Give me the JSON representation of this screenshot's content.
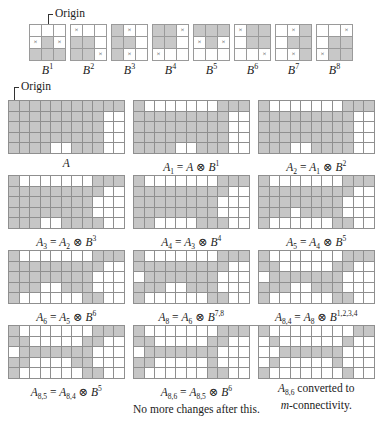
{
  "origin_label": "Origin",
  "structuring_elements": [
    {
      "name": "B",
      "sup": "1",
      "cells": [
        "W",
        "W",
        "W",
        "X",
        "F",
        "X",
        "F",
        "F",
        "F"
      ]
    },
    {
      "name": "B",
      "sup": "2",
      "cells": [
        "X",
        "W",
        "W",
        "F",
        "F",
        "W",
        "F",
        "F",
        "X"
      ]
    },
    {
      "name": "B",
      "sup": "3",
      "cells": [
        "F",
        "X",
        "W",
        "F",
        "F",
        "W",
        "F",
        "X",
        "W"
      ]
    },
    {
      "name": "B",
      "sup": "4",
      "cells": [
        "F",
        "F",
        "X",
        "F",
        "F",
        "W",
        "X",
        "W",
        "W"
      ]
    },
    {
      "name": "B",
      "sup": "5",
      "cells": [
        "F",
        "F",
        "F",
        "X",
        "F",
        "X",
        "W",
        "W",
        "W"
      ]
    },
    {
      "name": "B",
      "sup": "6",
      "cells": [
        "X",
        "F",
        "F",
        "W",
        "F",
        "F",
        "W",
        "W",
        "X"
      ]
    },
    {
      "name": "B",
      "sup": "7",
      "cells": [
        "W",
        "X",
        "F",
        "W",
        "F",
        "F",
        "W",
        "X",
        "F"
      ]
    },
    {
      "name": "B",
      "sup": "8",
      "cells": [
        "W",
        "W",
        "X",
        "W",
        "F",
        "F",
        "X",
        "F",
        "F"
      ]
    }
  ],
  "cross_symbol": "×",
  "panels": [
    {
      "id": "A",
      "caption": {
        "lhs": "A",
        "lhs_sub": "",
        "rhs": "",
        "rhs_sub": "",
        "op": "",
        "se": "",
        "se_sup": "",
        "extra": ""
      },
      "rows": [
        "11111111111",
        "11111111100",
        "11111111100",
        "11111111100",
        "11110011100"
      ]
    },
    {
      "id": "A1",
      "caption": {
        "lhs": "A",
        "lhs_sub": "1",
        "rhs": "A",
        "rhs_sub": "",
        "op": "⊗",
        "se": "B",
        "se_sup": "1",
        "extra": ""
      },
      "rows": [
        "10000000111",
        "11111111100",
        "11111111100",
        "11111111100",
        "11110011100"
      ]
    },
    {
      "id": "A2",
      "caption": {
        "lhs": "A",
        "lhs_sub": "2",
        "rhs": "A",
        "rhs_sub": "1",
        "op": "⊗",
        "se": "B",
        "se_sup": "2",
        "extra": ""
      },
      "rows": [
        "10000000111",
        "11111111100",
        "11111111100",
        "11111111100",
        "11100111100"
      ]
    },
    {
      "id": "A3",
      "caption": {
        "lhs": "A",
        "lhs_sub": "3",
        "rhs": "A",
        "rhs_sub": "2",
        "op": "⊗",
        "se": "B",
        "se_sup": "3",
        "extra": ""
      },
      "rows": [
        "10000000111",
        "11111111100",
        "11111111000",
        "11111111000",
        "11100111100"
      ]
    },
    {
      "id": "A4",
      "caption": {
        "lhs": "A",
        "lhs_sub": "4",
        "rhs": "A",
        "rhs_sub": "3",
        "op": "⊗",
        "se": "B",
        "se_sup": "4",
        "extra": ""
      },
      "rows": [
        "10000000111",
        "11111111100",
        "11111111000",
        "11111111000",
        "11000011100"
      ]
    },
    {
      "id": "A5",
      "caption": {
        "lhs": "A",
        "lhs_sub": "5",
        "rhs": "A",
        "rhs_sub": "4",
        "op": "⊗",
        "se": "B",
        "se_sup": "5",
        "extra": ""
      },
      "rows": [
        "10000000111",
        "11111111100",
        "11111111000",
        "11101111000",
        "10000001100"
      ]
    },
    {
      "id": "A6",
      "caption": {
        "lhs": "A",
        "lhs_sub": "6",
        "rhs": "A",
        "rhs_sub": "5",
        "op": "⊗",
        "se": "B",
        "se_sup": "6",
        "extra": ""
      },
      "rows": [
        "10000000111",
        "11111111100",
        "11111111000",
        "11100111000",
        "10000001100"
      ]
    },
    {
      "id": "A8",
      "caption": {
        "lhs": "A",
        "lhs_sub": "8",
        "rhs": "A",
        "rhs_sub": "6",
        "op": "⊗",
        "se": "B",
        "se_sup": "7,8",
        "extra": ""
      },
      "rows": [
        "10000000111",
        "11111111100",
        "01111111000",
        "11100111000",
        "10000001100"
      ]
    },
    {
      "id": "A84",
      "caption": {
        "lhs": "A",
        "lhs_sub": "8,4",
        "rhs": "A",
        "rhs_sub": "8",
        "op": "⊗",
        "se": "B",
        "se_sup": "1,2,3,4",
        "extra": ""
      },
      "rows": [
        "10000000111",
        "11000001100",
        "01111111000",
        "11100111000",
        "10000001100"
      ]
    },
    {
      "id": "A85",
      "caption": {
        "lhs": "A",
        "lhs_sub": "8,5",
        "rhs": "A",
        "rhs_sub": "8,4",
        "op": "⊗",
        "se": "B",
        "se_sup": "5",
        "extra": ""
      },
      "rows": [
        "10000000111",
        "11000001100",
        "01111111000",
        "11000011000",
        "10000001100"
      ]
    },
    {
      "id": "A86",
      "caption": {
        "lhs": "A",
        "lhs_sub": "8,6",
        "rhs": "A",
        "rhs_sub": "8,5",
        "op": "⊗",
        "se": "B",
        "se_sup": "6",
        "extra": "No more changes after this."
      },
      "rows": [
        "10000000111",
        "11000001100",
        "01111111000",
        "11000001000",
        "10000001100"
      ]
    },
    {
      "id": "Am",
      "caption": {
        "lhs": "A",
        "lhs_sub": "8,6",
        "text": "converted to",
        "line2_italic": "m",
        "line2_rest": "-connectivity."
      },
      "rows": [
        "10000000011",
        "01000000100",
        "00111111000",
        "01000001000",
        "10000000100"
      ]
    }
  ],
  "colors": {
    "filled": "#c6c6c6",
    "empty": "#ffffff",
    "grid_line": "#8f8f8f"
  }
}
